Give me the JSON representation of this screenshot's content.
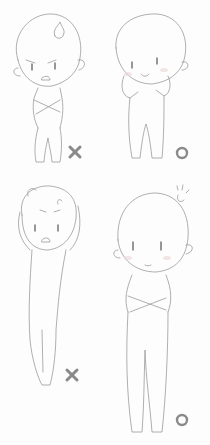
{
  "illustration": {
    "style": "pencil sketch, chibi pose reference",
    "colors": {
      "background": "#fdfdfd",
      "line": "#9a9a9a",
      "mark": "#8a8a8a"
    },
    "panels": [
      {
        "id": "top-left",
        "pose": "arms crossed, angry face, anger symbol on head",
        "verdict": "wrong",
        "mark": "×"
      },
      {
        "id": "top-right",
        "pose": "hands on cheeks, smiling, blushing",
        "verdict": "right",
        "mark": "○"
      },
      {
        "id": "bottom-left",
        "pose": "arms raised over head, stretched tall body, angry",
        "verdict": "wrong",
        "mark": "×"
      },
      {
        "id": "bottom-right",
        "pose": "arms crossed, tall body, calm face, sparkle on head",
        "verdict": "right",
        "mark": "○"
      }
    ]
  }
}
